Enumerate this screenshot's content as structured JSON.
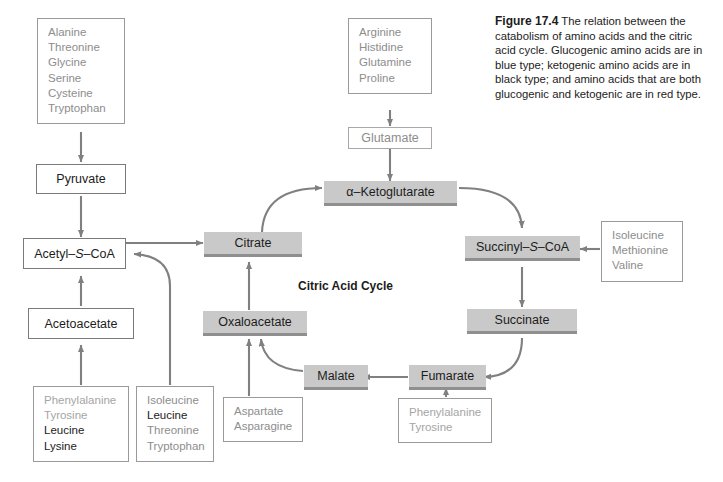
{
  "figure": {
    "label": "Figure 17.4",
    "caption": "The relation between the catabolism of amino acids and the citric acid cycle. Glucogenic amino acids are in blue type; ketogenic amino acids are in black type; and amino acids that are both glucogenic and ketogenic are in red type."
  },
  "cycle": {
    "title": "Citric Acid Cycle",
    "nodes": {
      "ketoglutarate": "α–Ketoglutarate",
      "citrate": "Citrate",
      "succinyl_coa_pre": "Succinyl–",
      "succinyl_coa_s": "S",
      "succinyl_coa_post": "–CoA",
      "succinate": "Succinate",
      "oxaloacetate": "Oxaloacetate",
      "malate": "Malate",
      "fumarate": "Fumarate"
    }
  },
  "metabolites": {
    "pyruvate": "Pyruvate",
    "acetyl_coa_pre": "Acetyl–",
    "acetyl_coa_s": "S",
    "acetyl_coa_post": "–CoA",
    "acetoacetate": "Acetoacetate",
    "glutamate": "Glutamate"
  },
  "amino_acid_boxes": {
    "top_left": {
      "name": "pyruvate-precursors",
      "items": [
        {
          "label": "Alanine",
          "type": "glucogenic"
        },
        {
          "label": "Threonine",
          "type": "glucogenic"
        },
        {
          "label": "Glycine",
          "type": "glucogenic"
        },
        {
          "label": "Serine",
          "type": "glucogenic"
        },
        {
          "label": "Cysteine",
          "type": "glucogenic"
        },
        {
          "label": "Tryptophan",
          "type": "glucogenic"
        }
      ]
    },
    "top_center": {
      "name": "glutamate-precursors",
      "items": [
        {
          "label": "Arginine",
          "type": "glucogenic"
        },
        {
          "label": "Histidine",
          "type": "glucogenic"
        },
        {
          "label": "Glutamine",
          "type": "glucogenic"
        },
        {
          "label": "Proline",
          "type": "glucogenic"
        }
      ]
    },
    "right": {
      "name": "succinyl-coa-precursors",
      "items": [
        {
          "label": "Isoleucine",
          "type": "glucogenic"
        },
        {
          "label": "Methionine",
          "type": "glucogenic"
        },
        {
          "label": "Valine",
          "type": "glucogenic"
        }
      ]
    },
    "bottom_left_1": {
      "name": "acetoacetate-precursors",
      "items": [
        {
          "label": "Phenylalanine",
          "type": "both"
        },
        {
          "label": "Tyrosine",
          "type": "both"
        },
        {
          "label": "Leucine",
          "type": "ketogenic"
        },
        {
          "label": "Lysine",
          "type": "ketogenic"
        }
      ]
    },
    "bottom_left_2": {
      "name": "acetyl-coa-precursors",
      "items": [
        {
          "label": "Isoleucine",
          "type": "glucogenic"
        },
        {
          "label": "Leucine",
          "type": "ketogenic"
        },
        {
          "label": "Threonine",
          "type": "glucogenic"
        },
        {
          "label": "Tryptophan",
          "type": "glucogenic"
        }
      ]
    },
    "bottom_center": {
      "name": "oxaloacetate-precursors",
      "items": [
        {
          "label": "Aspartate",
          "type": "glucogenic"
        },
        {
          "label": "Asparagine",
          "type": "glucogenic"
        }
      ]
    },
    "bottom_right": {
      "name": "fumarate-precursors",
      "items": [
        {
          "label": "Phenylalanine",
          "type": "both"
        },
        {
          "label": "Tyrosine",
          "type": "both"
        }
      ]
    }
  },
  "colors": {
    "node_fill": "#c9c9c9",
    "node_shadow": "#8f8f8f",
    "arrow": "#808080",
    "glucogenic_text": "#8d8d8d",
    "ketogenic_text": "#1c1c1c",
    "both_text": "#a5a5a5"
  }
}
